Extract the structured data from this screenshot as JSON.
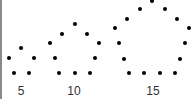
{
  "colors": {
    "dot": "#000000",
    "label": "#333333",
    "edge": "#8a8a8a"
  },
  "figures": [
    {
      "name": "pentagon-5",
      "label": "5",
      "dot_count": 5
    },
    {
      "name": "pentagon-10",
      "label": "10",
      "dot_count": 10
    },
    {
      "name": "pentagon-15",
      "label": "15",
      "dot_count": 15
    }
  ]
}
